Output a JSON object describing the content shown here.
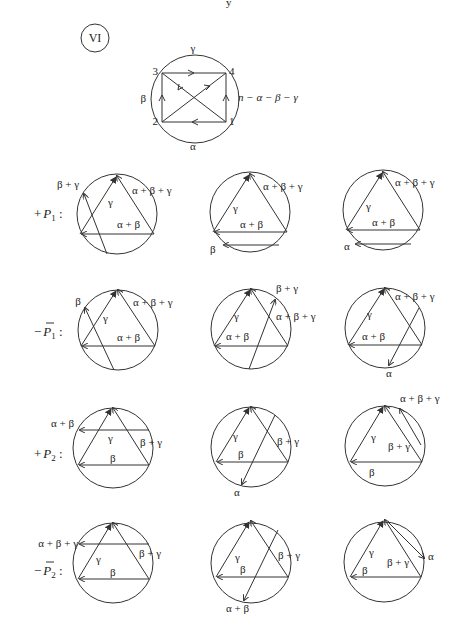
{
  "page_marker": "y",
  "case_badge": "VI",
  "top_diagram": {
    "vertices": [
      "1",
      "2",
      "3",
      "4"
    ],
    "arc_labels": {
      "top": "γ",
      "left": "β",
      "bottom": "α",
      "right": "n − α − β − γ"
    }
  },
  "rows": [
    {
      "label_sign": "+",
      "label_symbol": "P",
      "label_sub": "1",
      "label_bar": false,
      "panels": [
        {
          "labels": [
            "β + γ",
            "γ",
            "α + β + γ",
            "α + β"
          ]
        },
        {
          "labels": [
            "γ",
            "α + β + γ",
            "α + β",
            "β"
          ]
        },
        {
          "labels": [
            "γ",
            "α + β + γ",
            "α + β",
            "α"
          ]
        }
      ]
    },
    {
      "label_sign": "−",
      "label_symbol": "P",
      "label_sub": "1",
      "label_bar": true,
      "panels": [
        {
          "labels": [
            "β",
            "γ",
            "α + β + γ",
            "α + β"
          ]
        },
        {
          "labels": [
            "β + γ",
            "γ",
            "α + β + γ",
            "α + β"
          ]
        },
        {
          "labels": [
            "α + β + γ",
            "γ",
            "α + β",
            "α"
          ]
        }
      ]
    },
    {
      "label_sign": "+",
      "label_symbol": "P",
      "label_sub": "2",
      "label_bar": false,
      "panels": [
        {
          "labels": [
            "α + β",
            "γ",
            "β + γ",
            "β"
          ]
        },
        {
          "labels": [
            "γ",
            "β + γ",
            "β",
            "α"
          ]
        },
        {
          "labels": [
            "α + β + γ",
            "γ",
            "β + γ",
            "β"
          ]
        }
      ]
    },
    {
      "label_sign": "−",
      "label_symbol": "P",
      "label_sub": "2",
      "label_bar": true,
      "panels": [
        {
          "labels": [
            "α + β + γ",
            "γ",
            "β + γ",
            "β"
          ]
        },
        {
          "labels": [
            "γ",
            "β + γ",
            "β",
            "α + β"
          ]
        },
        {
          "labels": [
            "γ",
            "β + γ",
            "β",
            "α"
          ]
        }
      ]
    }
  ]
}
